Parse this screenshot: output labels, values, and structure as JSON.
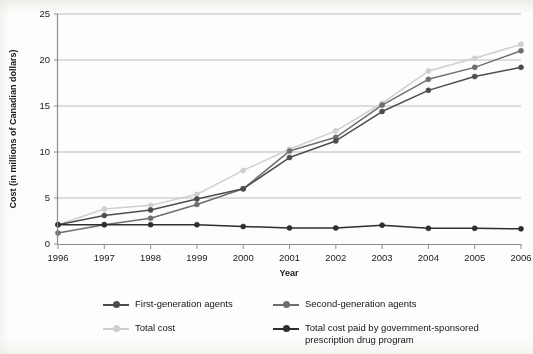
{
  "chart_data": {
    "type": "line",
    "title": "",
    "xlabel": "Year",
    "ylabel": "Cost (in millions of Canadian dollars)",
    "categories": [
      "1996",
      "1997",
      "1998",
      "1999",
      "2000",
      "2001",
      "2002",
      "2003",
      "2004",
      "2005",
      "2006"
    ],
    "x": [
      1996,
      1997,
      1998,
      1999,
      2000,
      2001,
      2002,
      2003,
      2004,
      2005,
      2006
    ],
    "xlim": [
      1996,
      2006
    ],
    "ylim": [
      0,
      25
    ],
    "yticks": [
      0,
      5,
      10,
      15,
      20,
      25
    ],
    "ytick_labels": [
      "0",
      "5",
      "10",
      "15",
      "20",
      "25"
    ],
    "xtick_labels": [
      "1996",
      "1997",
      "1998",
      "1999",
      "2000",
      "2001",
      "2002",
      "2003",
      "2004",
      "2005",
      "2006"
    ],
    "grid": "horizontal",
    "legend_position": "below",
    "series": [
      {
        "name": "First-generation agents",
        "color": "#4d4d4d",
        "values": [
          2.1,
          3.1,
          3.7,
          4.9,
          6.0,
          9.4,
          11.2,
          14.4,
          16.7,
          18.2,
          19.2
        ]
      },
      {
        "name": "Second-generation agents",
        "color": "#6e6e6e",
        "values": [
          1.2,
          2.1,
          2.8,
          4.3,
          6.0,
          10.1,
          11.6,
          15.1,
          17.9,
          19.2,
          21.0
        ]
      },
      {
        "name": "Total cost",
        "color": "#cfcfcf",
        "values": [
          2.1,
          3.8,
          4.2,
          5.4,
          8.0,
          10.3,
          12.3,
          15.3,
          18.8,
          20.2,
          21.7
        ]
      },
      {
        "name": "Total cost paid by government-sponsored\nprescription drug program",
        "color": "#2e2e2e",
        "values": [
          2.1,
          2.1,
          2.1,
          2.1,
          1.9,
          1.75,
          1.75,
          2.05,
          1.7,
          1.7,
          1.65
        ]
      }
    ]
  },
  "legend": {
    "items": [
      {
        "label": "First-generation agents",
        "color": "#4d4d4d"
      },
      {
        "label": "Second-generation agents",
        "color": "#6e6e6e"
      },
      {
        "label": "Total cost",
        "color": "#cfcfcf"
      },
      {
        "label": "Total cost paid by government-sponsored\nprescription drug program",
        "color": "#2e2e2e"
      }
    ]
  },
  "style": {
    "axis_color": "#8d8d8d",
    "grid_color": "#b3b3b3",
    "background": "#fdfdfc"
  }
}
